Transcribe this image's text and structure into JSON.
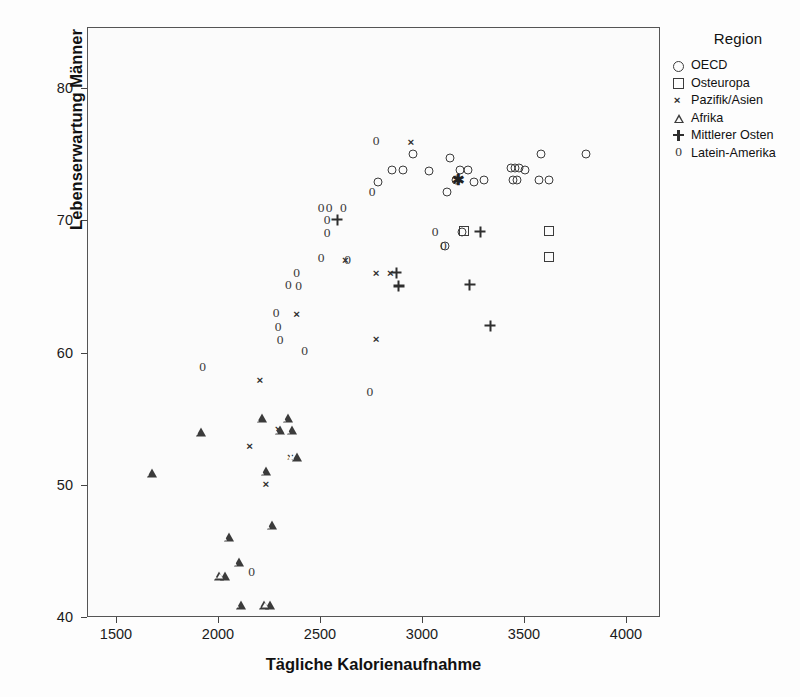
{
  "chart_data": {
    "type": "scatter",
    "title": "",
    "xlabel": "Tägliche Kalorienaufnahme",
    "ylabel": "Lebenserwartung Männer",
    "xlim": [
      1340,
      4150
    ],
    "ylim": [
      40,
      83.7
    ],
    "xticks": [
      1500,
      2000,
      2500,
      3000,
      3500,
      4000
    ],
    "yticks": [
      40,
      50,
      60,
      70,
      80
    ],
    "grid": false,
    "legend_title": "Region",
    "legend_position": "right",
    "series": [
      {
        "name": "OECD",
        "marker": "circle",
        "points": [
          [
            2950,
            75.1
          ],
          [
            2850,
            73.9
          ],
          [
            2900,
            73.9
          ],
          [
            2780,
            73.0
          ],
          [
            3030,
            73.8
          ],
          [
            3130,
            74.8
          ],
          [
            3180,
            73.9
          ],
          [
            3220,
            73.9
          ],
          [
            3160,
            73.1
          ],
          [
            3250,
            73.0
          ],
          [
            3300,
            73.1
          ],
          [
            3430,
            74.0
          ],
          [
            3450,
            74.0
          ],
          [
            3470,
            74.0
          ],
          [
            3500,
            73.9
          ],
          [
            3580,
            75.1
          ],
          [
            3440,
            73.1
          ],
          [
            3460,
            73.1
          ],
          [
            3570,
            73.1
          ],
          [
            3620,
            73.1
          ],
          [
            3800,
            75.1
          ],
          [
            3120,
            72.2
          ],
          [
            3110,
            68.1
          ],
          [
            3190,
            69.2
          ]
        ]
      },
      {
        "name": "Osteuropa",
        "marker": "square",
        "points": [
          [
            3200,
            69.3
          ],
          [
            3620,
            69.3
          ],
          [
            3620,
            67.3
          ]
        ]
      },
      {
        "name": "Pazifik/Asien",
        "marker": "x",
        "points": [
          [
            2940,
            76.0
          ],
          [
            2620,
            67.1
          ],
          [
            2770,
            66.1
          ],
          [
            2840,
            66.1
          ],
          [
            2380,
            63.0
          ],
          [
            2200,
            58.0
          ],
          [
            2150,
            53.0
          ],
          [
            2230,
            50.1
          ],
          [
            2350,
            52.2
          ],
          [
            2290,
            54.3
          ],
          [
            2770,
            61.1
          ]
        ]
      },
      {
        "name": "Afrika",
        "marker": "triangle",
        "points": [
          [
            1670,
            51.0
          ],
          [
            1910,
            54.1
          ],
          [
            2210,
            55.1
          ],
          [
            2340,
            55.1
          ],
          [
            2300,
            54.2
          ],
          [
            2360,
            54.2
          ],
          [
            2230,
            51.1
          ],
          [
            2380,
            52.2
          ],
          [
            2050,
            46.1
          ],
          [
            2000,
            43.2
          ],
          [
            2030,
            43.2
          ],
          [
            2100,
            44.2
          ],
          [
            2260,
            47.0
          ],
          [
            2110,
            41.0
          ],
          [
            2220,
            41.0
          ],
          [
            2250,
            41.0
          ]
        ]
      },
      {
        "name": "Mittlerer Osten",
        "marker": "plus",
        "points": [
          [
            2580,
            70.1
          ],
          [
            3280,
            69.2
          ],
          [
            2870,
            66.1
          ],
          [
            2880,
            65.1
          ],
          [
            3230,
            65.2
          ],
          [
            3330,
            62.1
          ]
        ]
      },
      {
        "name": "Latein-Amerika",
        "marker": "zero",
        "points": [
          [
            2770,
            76.1
          ],
          [
            2500,
            71.0
          ],
          [
            2540,
            71.0
          ],
          [
            2610,
            71.0
          ],
          [
            2530,
            70.1
          ],
          [
            2530,
            69.1
          ],
          [
            2500,
            67.2
          ],
          [
            2630,
            67.1
          ],
          [
            2380,
            66.1
          ],
          [
            2340,
            65.2
          ],
          [
            2390,
            65.1
          ],
          [
            2280,
            63.1
          ],
          [
            2290,
            62.0
          ],
          [
            2300,
            61.0
          ],
          [
            2420,
            60.2
          ],
          [
            2750,
            72.2
          ],
          [
            2740,
            57.1
          ],
          [
            1920,
            59.0
          ],
          [
            3060,
            69.2
          ],
          [
            3100,
            68.1
          ],
          [
            2160,
            43.5
          ]
        ]
      }
    ],
    "overlap_marker": {
      "note": "overlapping symbols rendered as star",
      "point": [
        3170,
        73.2
      ]
    }
  },
  "axis": {
    "x_tick_labels": [
      "1500",
      "2000",
      "2500",
      "3000",
      "3500",
      "4000"
    ],
    "y_tick_labels": [
      "40",
      "50",
      "60",
      "70",
      "80"
    ]
  },
  "legend": {
    "title": "Region",
    "entries": [
      {
        "label": "OECD",
        "marker": "circle-icon"
      },
      {
        "label": "Osteuropa",
        "marker": "square-icon"
      },
      {
        "label": "Pazifik/Asien",
        "marker": "x-icon"
      },
      {
        "label": "Afrika",
        "marker": "triangle-icon"
      },
      {
        "label": "Mittlerer Osten",
        "marker": "plus-icon"
      },
      {
        "label": "Latein-Amerika",
        "marker": "zero-icon"
      }
    ]
  }
}
